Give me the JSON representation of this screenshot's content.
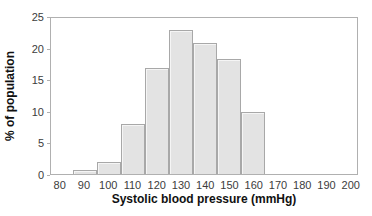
{
  "chart_data": {
    "type": "bar",
    "subtype": "histogram",
    "title": "",
    "xlabel": "Systolic blood pressure (mmHg)",
    "ylabel": "% of population",
    "categories": [
      90,
      100,
      110,
      120,
      130,
      140,
      150,
      160
    ],
    "values": [
      0.7,
      2,
      8,
      17,
      23,
      21,
      18.5,
      10
    ],
    "bin_width": 10,
    "x_ticks": [
      80,
      90,
      100,
      110,
      120,
      130,
      140,
      150,
      160,
      170,
      180,
      190,
      200
    ],
    "y_ticks": [
      0,
      5,
      10,
      15,
      20,
      25
    ],
    "xlim": [
      76,
      203
    ],
    "ylim": [
      0,
      25
    ],
    "grid": false,
    "legend": false,
    "colors": {
      "bar_fill": "#e3e3e3",
      "bar_border": "#a8a8a8",
      "axis": "#b0b0b0",
      "tick_label": "#3c3c3c",
      "axis_label": "#111111",
      "background": "#ffffff"
    }
  }
}
